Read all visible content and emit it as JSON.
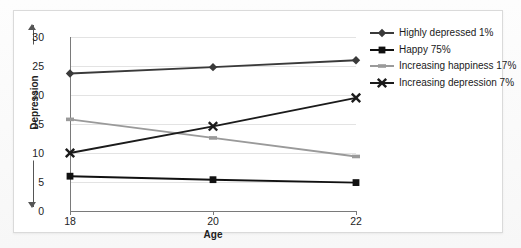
{
  "chart_data": {
    "type": "line",
    "title": "",
    "xlabel": "Age",
    "ylabel": "Depression",
    "x": [
      18,
      20,
      22
    ],
    "xticklabels": [
      "18",
      "20",
      "22"
    ],
    "xlim": [
      18,
      22
    ],
    "ylim": [
      0,
      30
    ],
    "yticks": [
      0,
      5,
      10,
      15,
      20,
      25,
      30
    ],
    "yticklabels": [
      "0",
      "5",
      "10",
      "15",
      "20",
      "25",
      "30"
    ],
    "grid": "horizontal",
    "legend_position": "right",
    "series": [
      {
        "name": "Highly depressed 1%",
        "values": [
          23.7,
          24.8,
          26.0
        ],
        "color": "#3a3a3a",
        "marker": "diamond"
      },
      {
        "name": "Happy 75%",
        "values": [
          6.0,
          5.4,
          4.9
        ],
        "color": "#111111",
        "marker": "square"
      },
      {
        "name": "Increasing happiness 17%",
        "values": [
          15.8,
          12.6,
          9.4
        ],
        "color": "#9a9a9a",
        "marker": "dash"
      },
      {
        "name": "Increasing depression 7%",
        "values": [
          10.0,
          14.6,
          19.5
        ],
        "color": "#1b1b1b",
        "marker": "x"
      }
    ]
  },
  "axes": {
    "y_title": "Depression",
    "x_title": "Age",
    "y_ticks": [
      "30",
      "25",
      "20",
      "15",
      "10",
      "5",
      "0"
    ],
    "x_ticks": [
      "18",
      "20",
      "22"
    ]
  },
  "legend": {
    "items": [
      {
        "label": "Highly depressed 1%",
        "color": "#3a3a3a",
        "marker": "diamond"
      },
      {
        "label": "Happy 75%",
        "color": "#111111",
        "marker": "square"
      },
      {
        "label": "Increasing happiness 17%",
        "color": "#9a9a9a",
        "marker": "dash"
      },
      {
        "label": "Increasing depression 7%",
        "color": "#1b1b1b",
        "marker": "x"
      }
    ]
  },
  "colors": {
    "grid": "#e3e3e3",
    "axis": "#7a7a7a",
    "card_background": "#ffffff",
    "card_border": "#dadada",
    "page_background": "#fbfbfb"
  }
}
